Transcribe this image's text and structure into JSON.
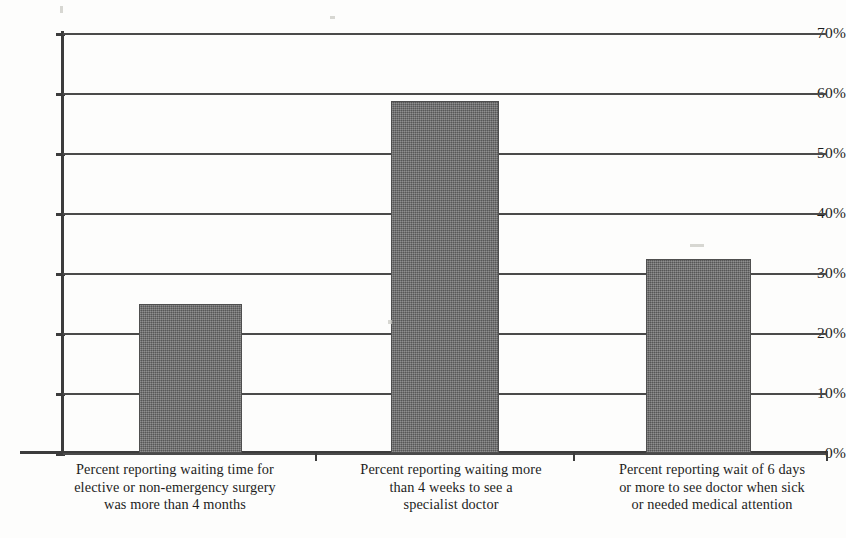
{
  "chart_data": {
    "type": "bar",
    "title": "",
    "xlabel": "",
    "ylabel": "",
    "categories": [
      "Percent reporting waiting time for elective or non-emergency surgery was more than 4 months",
      "Percent reporting waiting more than 4 weeks to see a specialist doctor",
      "Percent reporting wait of 6 days or more to see doctor when sick or needed medical attention"
    ],
    "category_lines": [
      [
        "Percent reporting waiting time for",
        "elective or non-emergency surgery",
        "was more than 4 months"
      ],
      [
        "Percent reporting waiting more",
        "than 4 weeks to see a",
        "specialist doctor"
      ],
      [
        "Percent reporting wait of 6 days",
        "or more to see doctor when sick",
        "or needed medical attention"
      ]
    ],
    "values": [
      24.8,
      58.6,
      32.3
    ],
    "ylim": [
      0,
      70
    ],
    "ytick_values": [
      70,
      60,
      50,
      40,
      30,
      20,
      10,
      0
    ],
    "ytick_labels": [
      "70%",
      "60%",
      "50%",
      "40%",
      "30%",
      "20%",
      "10%",
      "0%"
    ],
    "grid": "horizontal",
    "legend": "none",
    "bar_color": "#6b6b6b",
    "axis_color": "#3c3c3c",
    "grid_color": "#4a4a4a"
  }
}
